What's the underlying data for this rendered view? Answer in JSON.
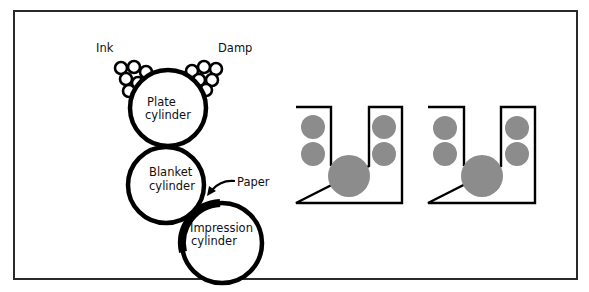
{
  "diagram": {
    "labels": {
      "ink": "Ink",
      "damp": "Damp",
      "plate_line1": "Plate",
      "plate_line2": "cylinder",
      "blanket_line1": "Blanket",
      "blanket_line2": "cylinder",
      "impression_line1": "Impression",
      "impression_line2": "cylinder",
      "paper": "Paper"
    },
    "cylinders": [
      {
        "name": "plate-cylinder",
        "label": "Plate cylinder"
      },
      {
        "name": "blanket-cylinder",
        "label": "Blanket cylinder"
      },
      {
        "name": "impression-cylinder",
        "label": "Impression cylinder"
      }
    ],
    "roller_groups": [
      {
        "name": "ink-rollers",
        "count": 6
      },
      {
        "name": "damp-rollers",
        "count": 6
      }
    ],
    "units": [
      {
        "name": "printing-unit-1",
        "small_rollers": 4,
        "large_rollers": 1
      },
      {
        "name": "printing-unit-2",
        "small_rollers": 4,
        "large_rollers": 1
      }
    ],
    "colors": {
      "stroke": "#000000",
      "roller_fill": "#8c8c8c",
      "frame": "#2a2a2a",
      "background": "#ffffff"
    }
  }
}
